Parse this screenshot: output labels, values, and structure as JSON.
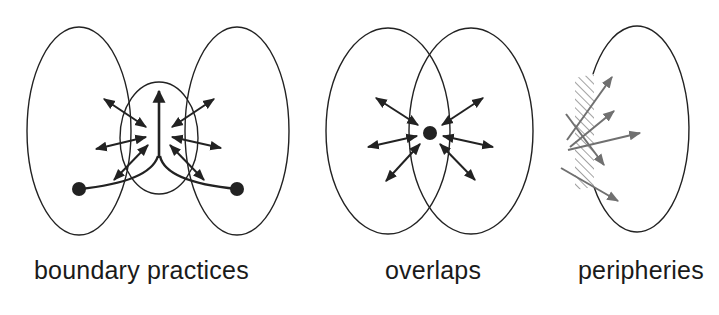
{
  "figure": {
    "panels": [
      {
        "id": "boundary",
        "label": "boundary practices"
      },
      {
        "id": "overlaps",
        "label": "overlaps"
      },
      {
        "id": "peripheries",
        "label": "peripheries"
      }
    ]
  },
  "colors": {
    "line": "#222222",
    "arrow": "#222222",
    "periphery_arrow": "#6e6e6e",
    "hatch": "#8a8a8a"
  }
}
